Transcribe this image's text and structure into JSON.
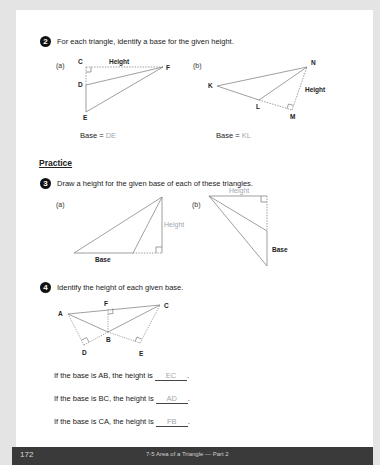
{
  "page": {
    "page_number": "172",
    "footer_title": "7-5 Area of a Triangle — Part 2"
  },
  "q2": {
    "number": "2",
    "prompt": "For each triangle, identify a base for the given height.",
    "a": {
      "sub_label": "(a)",
      "vertices": [
        "C",
        "D",
        "E",
        "F"
      ],
      "height_label": "Height",
      "base_prefix": "Base = ",
      "answer": "DE"
    },
    "b": {
      "sub_label": "(b)",
      "vertices": [
        "K",
        "L",
        "M",
        "N"
      ],
      "height_label": "Height",
      "base_prefix": "Base = ",
      "answer": "KL"
    }
  },
  "practice": {
    "heading": "Practice"
  },
  "q3": {
    "number": "3",
    "prompt": "Draw a height for the given base of each of these triangles.",
    "a": {
      "sub_label": "(a)",
      "base_label": "Base",
      "height_label": "Height"
    },
    "b": {
      "sub_label": "(b)",
      "base_label": "Base",
      "height_label": "Height"
    }
  },
  "q4": {
    "number": "4",
    "prompt": "Identify the height of each given base.",
    "vertices": [
      "A",
      "B",
      "C",
      "D",
      "E",
      "F"
    ],
    "sentences": [
      {
        "text": "If the base is AB, the height is ",
        "answer": "EC",
        "end": "."
      },
      {
        "text": "If the base is BC, the height is ",
        "answer": "AD",
        "end": "."
      },
      {
        "text": "If the base is CA, the height is ",
        "answer": "FB",
        "end": "."
      }
    ]
  },
  "colors": {
    "answer": "#a0a8b0",
    "footer_bg": "#3a3a3a",
    "page_bg": "#ffffff",
    "outer_bg": "#e4e4e4"
  }
}
